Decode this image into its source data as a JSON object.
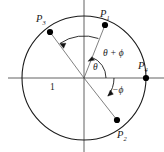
{
  "figure": {
    "background_color": "#ffffff",
    "stroke_color": "#1a1a1a",
    "point_color": "#000000",
    "radius_label": "1",
    "points": [
      {
        "id": "P1",
        "label_base": "P",
        "label_sub": "1",
        "x": 105,
        "y": 25,
        "label_x": 103,
        "label_y": 16,
        "angle_deg": 70
      },
      {
        "id": "P2",
        "label_base": "P",
        "label_sub": "2",
        "x": 117,
        "y": 120,
        "label_x": 119,
        "label_y": 134,
        "angle_deg": -37
      },
      {
        "id": "P3",
        "label_base": "P",
        "label_sub": "3",
        "x": 50,
        "y": 32,
        "label_x": 40,
        "label_y": 21,
        "angle_deg": 125
      },
      {
        "id": "P4",
        "label_base": "P",
        "label_sub": "4",
        "x": 146,
        "y": 78,
        "label_x": 140,
        "label_y": 68,
        "angle_deg": 0
      }
    ],
    "angle_labels": [
      {
        "id": "theta",
        "text": "θ",
        "x": 92,
        "y": 68
      },
      {
        "id": "theta_phi",
        "text": "θ + ϕ",
        "x": 105,
        "y": 53
      },
      {
        "id": "minus_phi",
        "text": "−ϕ",
        "x": 106,
        "y": 90
      }
    ],
    "circle": {
      "cx": 84,
      "cy": 78,
      "r": 62
    },
    "axes": {
      "horizontal": {
        "x1": 8,
        "y1": 78,
        "x2": 164,
        "y2": 78
      },
      "vertical": {
        "x1": 84,
        "y1": 0,
        "x2": 84,
        "y2": 152
      }
    },
    "arcs": [
      {
        "id": "arc-theta",
        "radius": 22,
        "start_deg": 0,
        "end_deg": 70,
        "arrow_at": "end"
      },
      {
        "id": "arc-theta-phi",
        "radius": 42,
        "start_deg": 70,
        "end_deg": 125,
        "arrow_at": "end"
      },
      {
        "id": "arc-minus-phi",
        "radius": 30,
        "start_deg": 0,
        "end_deg": -37,
        "arrow_at": "end"
      }
    ]
  }
}
